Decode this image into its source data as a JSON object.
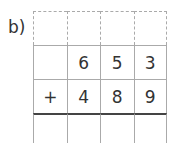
{
  "exercise": {
    "label": "b)",
    "rows": [
      {
        "type": "carry",
        "cells": [
          "",
          "",
          "",
          ""
        ]
      },
      {
        "type": "addend",
        "cells": [
          "",
          "6",
          "5",
          "3"
        ]
      },
      {
        "type": "addend",
        "cells": [
          "+",
          "4",
          "8",
          "9"
        ]
      },
      {
        "type": "result",
        "cells": [
          "",
          "",
          "",
          ""
        ]
      }
    ]
  }
}
